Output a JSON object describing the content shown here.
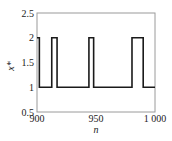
{
  "chart_data": {
    "type": "line",
    "style": "step",
    "title": "",
    "xlabel": "n",
    "ylabel": "x*",
    "xlim": [
      900,
      1000
    ],
    "ylim": [
      0.5,
      2.5
    ],
    "xticks": [
      900,
      950,
      1000
    ],
    "xtick_labels": [
      "900",
      "950",
      "1 000"
    ],
    "yticks": [
      0.5,
      1,
      1.5,
      2,
      2.5
    ],
    "ytick_labels": [
      "0.5",
      "1",
      "1.5",
      "2",
      "2.5"
    ],
    "grid": false,
    "legend": null,
    "series": [
      {
        "name": "x*",
        "color": "#1a1a1a",
        "x": [
          900,
          902,
          902,
          912.5,
          912.5,
          917,
          917,
          944,
          944,
          948,
          948,
          980.5,
          980.5,
          990,
          990,
          1000
        ],
        "y": [
          2,
          2,
          1,
          1,
          2,
          2,
          1,
          1,
          2,
          2,
          1,
          1,
          2,
          2,
          1,
          1
        ]
      }
    ]
  }
}
